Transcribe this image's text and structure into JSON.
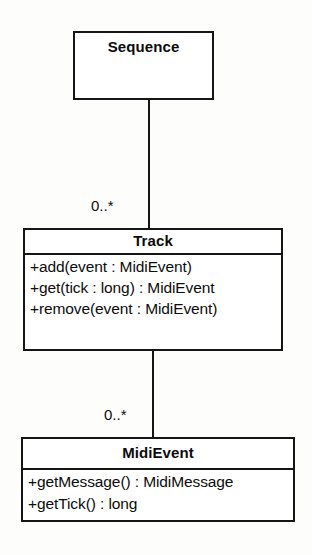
{
  "diagram": {
    "type": "uml-class-diagram",
    "title": "",
    "background_color": "#fdfdfc",
    "line_color": "#151515",
    "text_color": "#0c0c0c",
    "classes": [
      {
        "id": "sequence",
        "name": "Sequence",
        "members": []
      },
      {
        "id": "track",
        "name": "Track",
        "members": [
          "+add(event : MidiEvent)",
          "+get(tick : long) : MidiEvent",
          "+remove(event : MidiEvent)"
        ]
      },
      {
        "id": "midievent",
        "name": "MidiEvent",
        "members": [
          "+getMessage() : MidiMessage",
          "+getTick() : long"
        ]
      }
    ],
    "associations": [
      {
        "id": "sequence-track",
        "from": "Sequence",
        "to": "Track",
        "multiplicity": "0..*"
      },
      {
        "id": "track-midievent",
        "from": "Track",
        "to": "MidiEvent",
        "multiplicity": "0..*"
      }
    ]
  }
}
